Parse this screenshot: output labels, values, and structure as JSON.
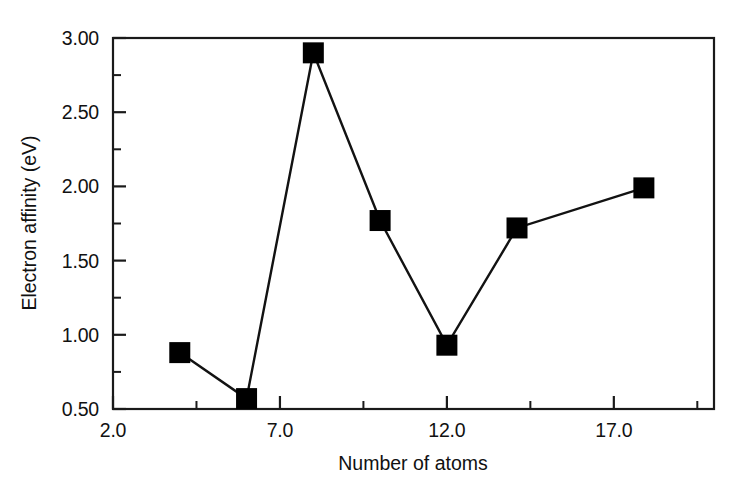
{
  "chart_data": {
    "type": "line",
    "title": "",
    "subtitle": "",
    "xlabel": "Number of atoms",
    "ylabel": "Electron affinity (eV)",
    "xlim": [
      2.0,
      20.0
    ],
    "ylim": [
      0.5,
      3.0
    ],
    "grid": false,
    "legend": null,
    "marker": "filled-square",
    "line_color": "#000000",
    "marker_color": "#000000",
    "x_ticks_major": [
      2.0,
      7.0,
      12.0,
      17.0
    ],
    "x_tick_labels": [
      "2.0",
      "7.0",
      "12.0",
      "17.0"
    ],
    "x_ticks_minor": [
      4.5,
      9.5,
      14.5,
      19.5
    ],
    "y_ticks_major": [
      0.5,
      1.0,
      1.5,
      2.0,
      2.5,
      3.0
    ],
    "y_tick_labels": [
      "0.50",
      "1.00",
      "1.50",
      "2.00",
      "2.50",
      "3.00"
    ],
    "y_ticks_minor": [
      0.75,
      1.25,
      1.75,
      2.25,
      2.75
    ],
    "x": [
      4.0,
      6.0,
      8.0,
      10.0,
      12.0,
      14.1,
      17.9
    ],
    "values": [
      0.88,
      0.57,
      2.9,
      1.77,
      0.93,
      1.72,
      1.99
    ],
    "points": [
      {
        "x": 4.0,
        "y": 0.88
      },
      {
        "x": 6.0,
        "y": 0.57
      },
      {
        "x": 8.0,
        "y": 2.9
      },
      {
        "x": 10.0,
        "y": 1.77
      },
      {
        "x": 12.0,
        "y": 0.93
      },
      {
        "x": 14.1,
        "y": 1.72
      },
      {
        "x": 17.9,
        "y": 1.99
      }
    ]
  },
  "axes": {
    "x_title": "Number of atoms",
    "y_title": "Electron affinity (eV)",
    "x_tick_labels": [
      "2.0",
      "7.0",
      "12.0",
      "17.0"
    ],
    "y_tick_labels": [
      "3.00",
      "2.50",
      "2.00",
      "1.50",
      "1.00",
      "0.50"
    ]
  }
}
